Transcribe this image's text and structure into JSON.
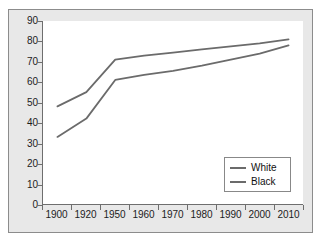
{
  "chart_data": {
    "type": "line",
    "title": "",
    "subtitle": "",
    "xlabel": "",
    "ylabel": "",
    "categories": [
      "1900",
      "1920",
      "1950",
      "1960",
      "1970",
      "1980",
      "1990",
      "2000",
      "2010"
    ],
    "series": [
      {
        "name": "White",
        "color": "#6b6b6b",
        "values": [
          48,
          55,
          71,
          73,
          74.5,
          76,
          77.5,
          79,
          81
        ]
      },
      {
        "name": "Black",
        "color": "#6b6b6b",
        "values": [
          33,
          42,
          61,
          63.5,
          65.5,
          68,
          71,
          74,
          78
        ]
      }
    ],
    "ylim": [
      0,
      90
    ],
    "ytick_step": 10,
    "yticks": [
      0,
      10,
      20,
      30,
      40,
      50,
      60,
      70,
      80,
      90
    ],
    "grid": false,
    "legend_position": "bottom-right",
    "annotations": []
  },
  "style": {
    "frame_border_color": "#8c8c8c",
    "band_background": "#e8e8e8",
    "plot_background": "#ffffff",
    "axis_color": "#6e6e6e",
    "text_color": "#1c1c1c",
    "legend_border_color": "#888888"
  }
}
